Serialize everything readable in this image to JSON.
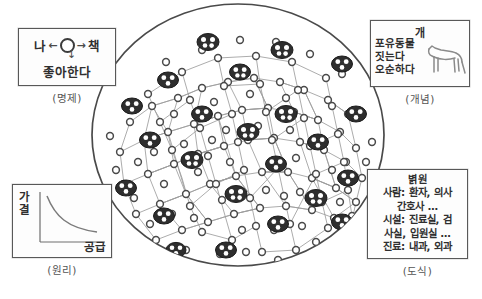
{
  "diagram": {
    "title_bottom_faint": "",
    "network": {
      "label": "knowledge-network-ellipse",
      "node_count_small": 128,
      "cluster_count": 22,
      "description": "elliptical semantic network of small circular nodes joined by thin lines, with dark ellipse clusters of 3-4 nodes"
    },
    "proposition_box": {
      "left_word": "나",
      "right_word": "책",
      "node_icon": "circle-node-icon",
      "arrow_left": "←",
      "arrow_right": "→",
      "arrow_down": "↓",
      "relation": "좋아한다",
      "caption": "(명제)"
    },
    "principle_box": {
      "ylabel": "가결",
      "ylabel_chars": [
        "가",
        "결"
      ],
      "xlabel": "공급",
      "caption": "(원리)",
      "curve": "downward-sloping convex curve"
    },
    "concept_box": {
      "title": "개",
      "attributes": [
        "포유동물",
        "짓는다",
        "오순하다"
      ],
      "illustration": "dog-silhouette-icon",
      "caption": "(개념)"
    },
    "schema_box": {
      "title": "별원",
      "lines": [
        "볅원",
        "사람: 환자, 의사",
        "간호사 …",
        "시설: 진료실, 검",
        "사실, 입원실 …",
        "진료: 내과, 외과"
      ],
      "caption": "(도식)"
    },
    "colors": {
      "ink": "#3a3a3a",
      "box_border": "#585858",
      "node_stroke": "#4a4a4a",
      "edge_stroke": "#9a9a9a",
      "cluster_fill": "#2e2e2e",
      "background": "#ffffff"
    }
  }
}
